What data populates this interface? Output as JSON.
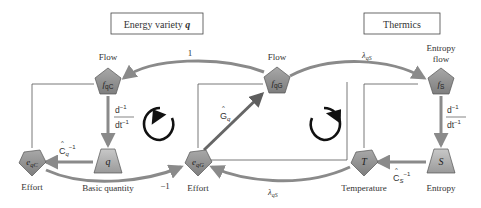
{
  "title_boxes": {
    "left": {
      "text": "Energy variety ",
      "var": "q"
    },
    "right": {
      "text": "Thermics"
    }
  },
  "nodes": {
    "fqC": {
      "symbol": "f",
      "sub": "qC",
      "label": "Flow",
      "shape": "pentagon"
    },
    "q": {
      "symbol": "q",
      "label": "Basic quantity",
      "shape": "trapezoid"
    },
    "eqC": {
      "symbol": "e",
      "sub": "qC",
      "label": "Effort",
      "shape": "pentagon-down"
    },
    "fqG": {
      "symbol": "f",
      "sub": "qG",
      "label": "Flow",
      "shape": "pentagon"
    },
    "eqG": {
      "symbol": "e",
      "sub": "qG",
      "label": "Effort",
      "shape": "pentagon-down"
    },
    "fS": {
      "symbol": "f",
      "sub": "S",
      "label_line1": "Entropy",
      "label_line2": "flow",
      "shape": "pentagon"
    },
    "T": {
      "symbol": "T",
      "label": "Temperature",
      "shape": "pentagon-down"
    },
    "S": {
      "symbol": "S",
      "label": "Entropy",
      "shape": "trapezoid"
    }
  },
  "edges": {
    "fqG_to_fqC": {
      "label": "1"
    },
    "eqC_to_eqG": {
      "label": "−1"
    },
    "fqG_to_fS": {
      "label_main": "λ",
      "label_sub": "qS"
    },
    "T_to_eqG": {
      "label_main": "λ",
      "label_sub": "qS"
    },
    "eqG_to_fqG": {
      "label_main": "G",
      "label_sub": "q"
    },
    "q_to_eqC": {
      "label_main": "C",
      "label_sub": "q",
      "label_sup": "−1"
    },
    "S_to_T": {
      "label_main": "C",
      "label_sub": "S",
      "label_sup": "−1"
    },
    "fqC_to_q": {
      "num": "d",
      "num_sup": "−1",
      "den": "dt",
      "den_sup": "−1"
    },
    "fS_to_S": {
      "num": "d",
      "num_sup": "−1",
      "den": "dt",
      "den_sup": "−1"
    }
  },
  "cycles": {
    "left": {
      "direction": "counterclockwise"
    },
    "right": {
      "direction": "clockwise"
    }
  },
  "colors": {
    "node_fill": "#8e8e8e",
    "node_fill_light": "#bdbdbd",
    "arrow": "#8a8a8a",
    "arrow_dark": "#6f6f6f",
    "line": "#555555",
    "text": "#333333",
    "cycle": "#111111"
  }
}
